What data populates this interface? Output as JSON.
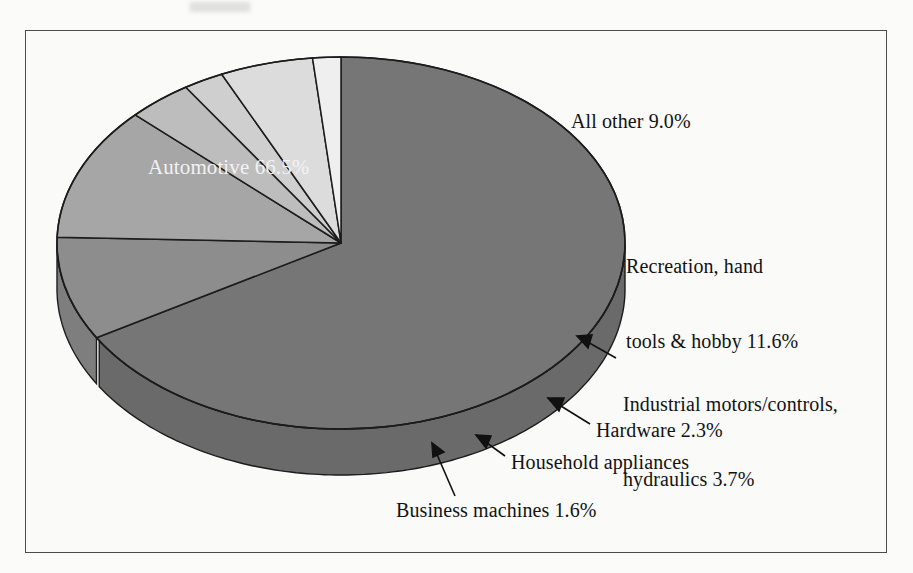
{
  "figure": {
    "background_color": "#fbfbfa",
    "frame_color": "#4c4c4c",
    "frame": {
      "x": 25,
      "y": 30,
      "width": 862,
      "height": 523
    }
  },
  "chart_data": {
    "type": "pie",
    "title": "",
    "subtitle": "",
    "xlabel": "",
    "ylabel": "",
    "three_d": true,
    "start_angle_deg": -90,
    "direction": "clockwise",
    "center": {
      "x": 341,
      "y": 243
    },
    "radius_x": 284,
    "radius_y": 186,
    "depth": 46,
    "legend_position": "callout-labels",
    "grid": false,
    "categories": [
      "Automotive",
      "All other",
      "Recreation, hand tools & hobby",
      "Industrial motors/controls, hydraulics",
      "Hardware",
      "Household appliances",
      "Business machines"
    ],
    "values": [
      66.5,
      9.0,
      11.6,
      3.7,
      2.3,
      5.3,
      1.6
    ],
    "slices": [
      {
        "name": "Automotive",
        "value": 66.5,
        "label": "Automotive 66.5%",
        "color": "#767676",
        "side_color": "#6a6a6a",
        "label_inside": true
      },
      {
        "name": "All other",
        "value": 9.0,
        "label": "All other 9.0%",
        "color": "#8d8d8d",
        "side_color": "#7e7e7e",
        "label_inside": false
      },
      {
        "name": "Recreation, hand tools & hobby",
        "value": 11.6,
        "label": "Recreation, hand\ntools & hobby 11.6%",
        "color": "#a6a6a6",
        "side_color": "#959595",
        "label_inside": false
      },
      {
        "name": "Industrial motors/controls, hydraulics",
        "value": 3.7,
        "label": "Industrial motors/controls,\nhydraulics 3.7%",
        "color": "#bdbdbd",
        "side_color": "#ababab",
        "label_inside": false
      },
      {
        "name": "Hardware",
        "value": 2.3,
        "label": "Hardware 2.3%",
        "color": "#cfcfcf",
        "side_color": "#bcbcbc",
        "label_inside": false
      },
      {
        "name": "Household appliances",
        "value": 5.3,
        "label": "Household appliances",
        "color": "#dcdcdc",
        "side_color": "#c8c8c8",
        "label_inside": false
      },
      {
        "name": "Business machines",
        "value": 1.6,
        "label": "Business machines 1.6%",
        "color": "#efefef",
        "side_color": "#d8d8d8",
        "label_inside": false
      }
    ]
  },
  "labels": {
    "automotive": "Automotive 66.5%",
    "all_other": "All other 9.0%",
    "recreation_line1": "Recreation, hand",
    "recreation_line2": "tools & hobby 11.6%",
    "industrial_line1": "Industrial motors/controls,",
    "industrial_line2": "hydraulics 3.7%",
    "hardware": "Hardware 2.3%",
    "household": "Household appliances",
    "business": "Business machines 1.6%"
  }
}
